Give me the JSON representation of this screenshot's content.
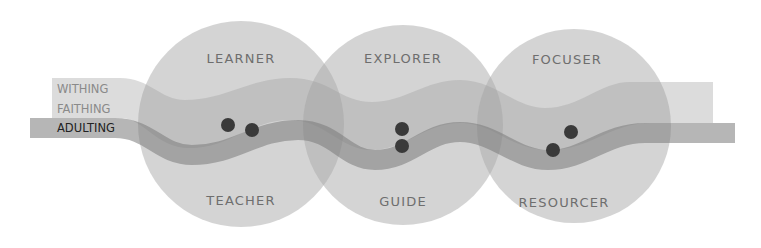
{
  "diagram": {
    "type": "venn-wave",
    "colors": {
      "background": "#ffffff",
      "circle_fill": "#a9a9a9",
      "light_band": "#9a9a9a",
      "dark_band": "#7a7a7a",
      "dot": "#3a3a3a",
      "label_muted": "#8a8a8a",
      "label_strong": "#222222",
      "circle_label": "#6e6e6e"
    },
    "circles": [
      {
        "id": "c1",
        "cx": 241,
        "cy": 124,
        "r": 103,
        "top_label": "LEARNER",
        "bottom_label": "TEACHER"
      },
      {
        "id": "c2",
        "cx": 403,
        "cy": 125,
        "r": 100,
        "top_label": "EXPLORER",
        "bottom_label": "GUIDE"
      },
      {
        "id": "c3",
        "cx": 574,
        "cy": 126,
        "r": 97,
        "top_label": "FOCUSER",
        "bottom_label": "RESOURCER"
      }
    ],
    "band_labels": [
      {
        "text": "WITHING",
        "style": "muted"
      },
      {
        "text": "FAITHING",
        "style": "muted"
      },
      {
        "text": "ADULTING",
        "style": "strong"
      }
    ],
    "dots": [
      {
        "cx": 228,
        "cy": 125
      },
      {
        "cx": 252,
        "cy": 130
      },
      {
        "cx": 402,
        "cy": 129
      },
      {
        "cx": 402,
        "cy": 146
      },
      {
        "cx": 571,
        "cy": 132
      },
      {
        "cx": 553,
        "cy": 150
      }
    ]
  }
}
